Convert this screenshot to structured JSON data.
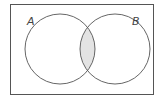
{
  "diagram": {
    "type": "venn",
    "universal_set": {
      "x": 10,
      "y": 4,
      "width": 143,
      "height": 90
    },
    "sets": [
      {
        "label": "A",
        "cx": 60,
        "cy": 49,
        "r": 35,
        "label_x": 27,
        "label_y": 25
      },
      {
        "label": "B",
        "cx": 115,
        "cy": 49,
        "r": 35,
        "label_x": 132,
        "label_y": 25
      }
    ],
    "shaded_region": "A ∩ B",
    "colors": {
      "outline": "#555555",
      "shading": "#e3e3e3",
      "background": "#ffffff"
    }
  }
}
